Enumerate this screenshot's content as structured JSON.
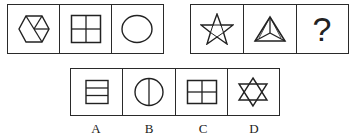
{
  "puzzle": {
    "row1": [
      {
        "figure": "hexagon-with-three-diagonals-icon"
      },
      {
        "figure": "square-quartered-icon"
      },
      {
        "figure": "circle-icon"
      }
    ],
    "row2": [
      {
        "figure": "pentagram-icon"
      },
      {
        "figure": "triangle-with-center-lines-icon"
      },
      {
        "figure": "question-mark",
        "text": "?"
      }
    ],
    "options": [
      {
        "label": "A",
        "figure": "rectangle-three-stripes-icon"
      },
      {
        "label": "B",
        "figure": "circle-with-vertical-line-icon"
      },
      {
        "label": "C",
        "figure": "square-quartered-icon"
      },
      {
        "label": "D",
        "figure": "hexagram-icon"
      }
    ]
  }
}
